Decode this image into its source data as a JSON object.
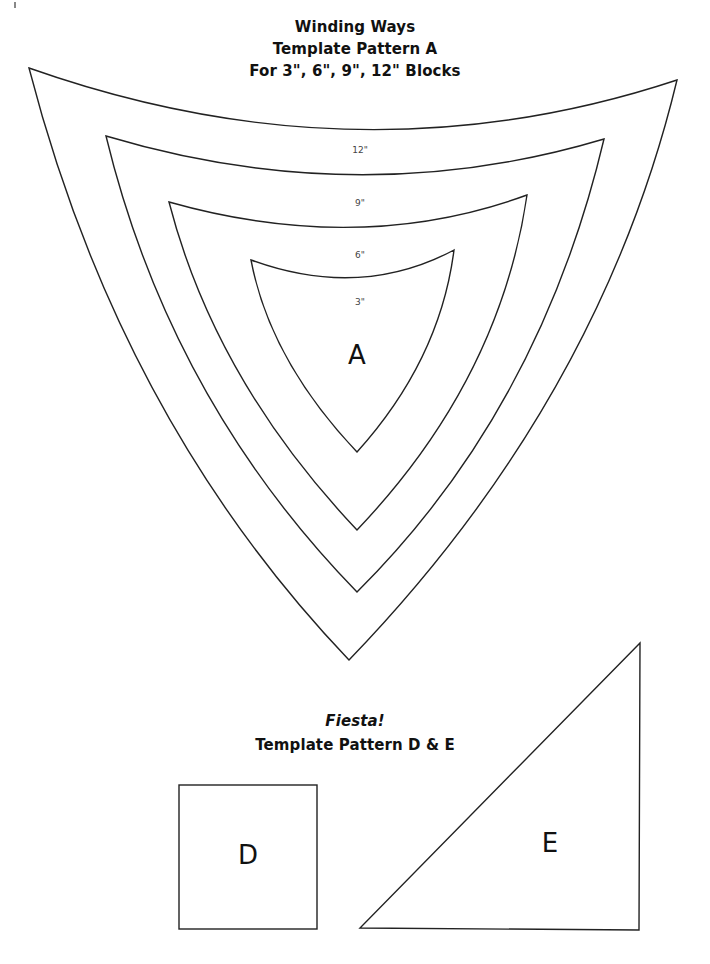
{
  "winding_ways": {
    "title": "Winding Ways",
    "subtitle": "Template Pattern A",
    "sizes_line": "For 3\", 6\", 9\", 12\" Blocks",
    "size_labels": [
      "12\"",
      "9\"",
      "6\"",
      "3\""
    ],
    "piece_letter": "A"
  },
  "fiesta": {
    "title": "Fiesta!",
    "subtitle": "Template Pattern D & E",
    "piece_d_letter": "D",
    "piece_e_letter": "E"
  },
  "colors": {
    "line": "#222222",
    "text": "#111111",
    "label": "#444444",
    "background": "#ffffff"
  }
}
